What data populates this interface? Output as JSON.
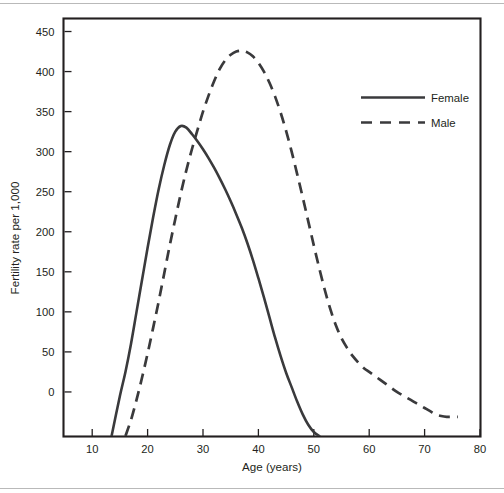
{
  "chart_data": {
    "type": "line",
    "title": "",
    "xlabel": "Age (years)",
    "ylabel": "Fertility rate per 1,000",
    "xlim": [
      5,
      80
    ],
    "ylim": [
      -55,
      465
    ],
    "xticks": [
      10,
      20,
      30,
      40,
      50,
      60,
      70,
      80
    ],
    "yticks": [
      0,
      50,
      100,
      150,
      200,
      250,
      300,
      350,
      400,
      450
    ],
    "xtick_labels": [
      "10",
      "20",
      "30",
      "40",
      "50",
      "60",
      "70",
      "80"
    ],
    "ytick_labels": [
      "0",
      "50",
      "100",
      "150",
      "200",
      "250",
      "300",
      "350",
      "400",
      "450"
    ],
    "grid": false,
    "legend_position": "top-right",
    "series": [
      {
        "name": "Female",
        "style": "solid",
        "color": "#3a3a3c",
        "x": [
          13.5,
          15,
          16,
          17,
          18,
          19,
          20,
          21,
          22,
          23,
          24,
          25,
          26,
          27,
          28,
          29,
          30,
          31,
          32,
          33,
          34,
          35,
          36,
          37,
          38,
          39,
          40,
          41,
          42,
          43,
          44,
          45,
          46,
          47,
          48,
          49,
          50,
          51
        ],
        "y": [
          -55,
          -5,
          25,
          60,
          100,
          140,
          180,
          218,
          253,
          283,
          308,
          325,
          332,
          330,
          322,
          313,
          303,
          292,
          280,
          267,
          253,
          238,
          222,
          205,
          186,
          165,
          142,
          118,
          93,
          68,
          45,
          24,
          6,
          -12,
          -28,
          -41,
          -50,
          -55
        ]
      },
      {
        "name": "Male",
        "style": "dashed",
        "color": "#3a3a3c",
        "x": [
          16,
          17,
          18,
          19,
          20,
          21,
          22,
          23,
          24,
          25,
          26,
          27,
          28,
          29,
          30,
          31,
          32,
          33,
          34,
          35,
          36,
          37,
          38,
          39,
          40,
          41,
          42,
          43,
          44,
          45,
          46,
          47,
          48,
          49,
          50,
          51,
          52,
          53,
          54,
          55,
          56,
          57,
          58,
          59,
          60,
          61,
          62,
          63,
          64,
          65,
          66,
          67,
          68,
          69,
          70,
          71,
          72,
          73,
          74,
          75,
          76
        ],
        "y": [
          -55,
          -35,
          -10,
          18,
          48,
          80,
          113,
          148,
          183,
          216,
          248,
          277,
          303,
          327,
          350,
          370,
          388,
          403,
          414,
          421,
          425,
          426,
          424,
          419,
          411,
          400,
          386,
          369,
          349,
          326,
          300,
          272,
          243,
          213,
          183,
          154,
          127,
          103,
          83,
          67,
          55,
          45,
          37,
          30,
          25,
          20,
          15,
          10,
          5,
          0,
          -4,
          -8,
          -12,
          -16,
          -20,
          -24,
          -28,
          -30,
          -31,
          -31,
          -31
        ]
      }
    ],
    "annotations": []
  },
  "legend": {
    "items": [
      {
        "label": "Female",
        "style": "solid"
      },
      {
        "label": "Male",
        "style": "dashed"
      }
    ]
  }
}
